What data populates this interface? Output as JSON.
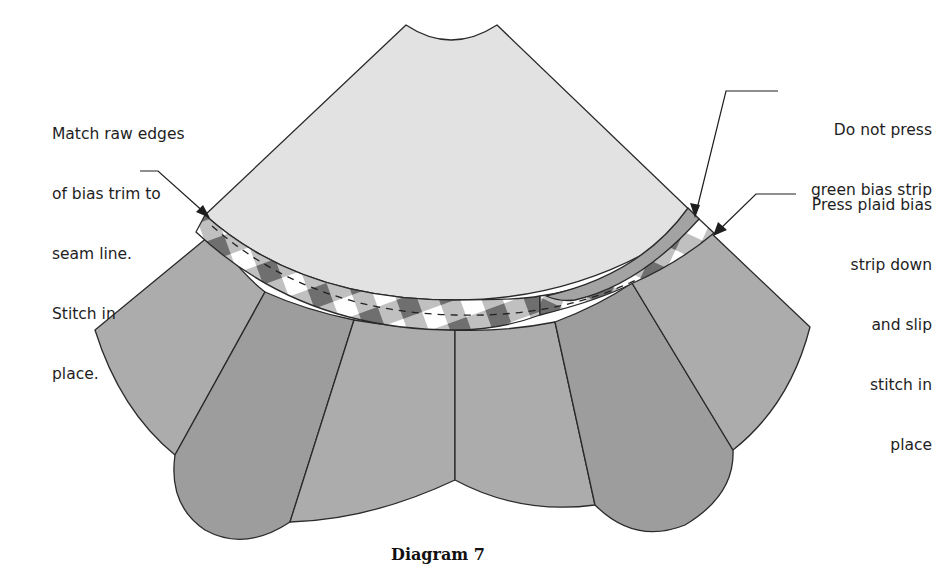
{
  "figure": {
    "caption": "Diagram 7",
    "colors": {
      "background": "#ffffff",
      "top_wedge": "#e2e2e2",
      "petal_light": "#acacac",
      "petal_dark": "#9d9d9d",
      "green_strip": "#a3a3a3",
      "plaid_dark": "#6f6f6f",
      "plaid_mid": "#b9b9b9",
      "plaid_light": "#ffffff",
      "outline": "#2a2a2a"
    }
  },
  "annotations": {
    "left": {
      "lines": [
        "Match raw edges",
        "of bias trim to",
        "seam line.",
        "Stitch in",
        "place."
      ]
    },
    "top_right": {
      "lines": [
        "Do not press",
        "green bias strip"
      ]
    },
    "right": {
      "lines": [
        "Press plaid bias",
        "strip down",
        "and slip",
        "stitch in",
        "place"
      ]
    }
  }
}
